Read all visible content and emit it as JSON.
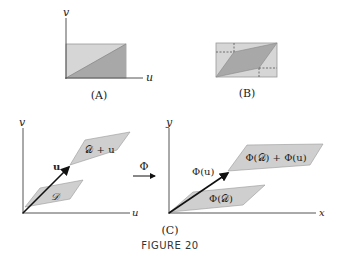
{
  "figure": {
    "caption": "FIGURE 20",
    "colors": {
      "light_fill": "#d6d6d6",
      "dark_fill": "#a8a8a8",
      "region_fill": "#cfcfcf",
      "axis": "#555555",
      "vector": "#111111"
    },
    "panel_a": {
      "label": "(A)",
      "x_axis_label": "u",
      "y_axis_label": "v"
    },
    "panel_b": {
      "label": "(B)"
    },
    "panel_c": {
      "label": "(C)",
      "left": {
        "x_axis_label": "u",
        "y_axis_label": "v",
        "vector_label": "u",
        "region_label": "𝒟",
        "translated_region_label": "𝒟 + u"
      },
      "map_label": "Φ",
      "right": {
        "x_axis_label": "x",
        "y_axis_label": "y",
        "vector_label": "Φ(u)",
        "region_label": "Φ(𝒟)",
        "translated_region_label": "Φ(𝒟) + Φ(u)"
      }
    }
  }
}
